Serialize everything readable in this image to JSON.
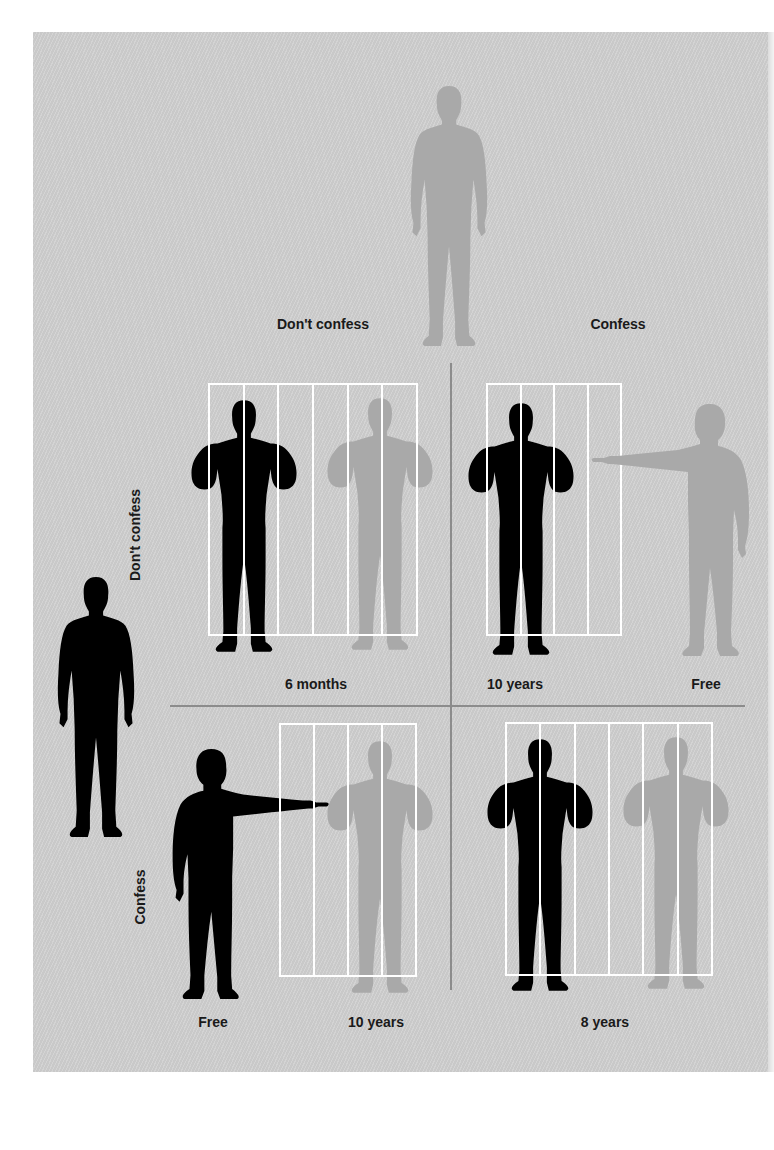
{
  "colors": {
    "background": "#cfcfcf",
    "prisoner_a": "#000000",
    "prisoner_b": "#a9a9a9",
    "bars": "#ffffff",
    "divider": "#8c8c8c",
    "text": "#1a1a1a"
  },
  "column_header": {
    "player": "prisoner-b",
    "options": [
      "Don't confess",
      "Confess"
    ]
  },
  "row_header": {
    "player": "prisoner-a",
    "options": [
      "Don't confess",
      "Confess"
    ]
  },
  "cells": [
    {
      "row": "Don't confess",
      "col": "Don't confess",
      "outcome_a": "6 months",
      "outcome_b": "",
      "shared_label": "6 months",
      "bars_a": 6,
      "figures": "both jailed"
    },
    {
      "row": "Don't confess",
      "col": "Confess",
      "outcome_a": "10 years",
      "outcome_b": "Free",
      "bars_a": 4,
      "figures": "B points at A"
    },
    {
      "row": "Confess",
      "col": "Don't confess",
      "outcome_a": "Free",
      "outcome_b": "10 years",
      "bars_b": 4,
      "figures": "A points at B"
    },
    {
      "row": "Confess",
      "col": "Confess",
      "outcome_a": "8 years",
      "outcome_b": "",
      "shared_label": "8 years",
      "bars_a": 6,
      "figures": "both jailed"
    }
  ],
  "labels": {
    "col0": "Don't confess",
    "col1": "Confess",
    "row0": "Don't confess",
    "row1": "Confess",
    "c00": "6 months",
    "c01_a": "10 years",
    "c01_b": "Free",
    "c10_a": "Free",
    "c10_b": "10 years",
    "c11": "8 years"
  }
}
